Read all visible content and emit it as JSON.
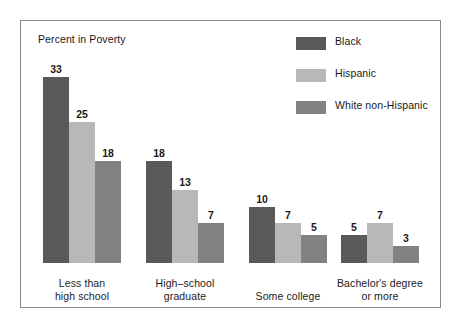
{
  "chart_data": {
    "type": "bar",
    "title": "Percent in Poverty",
    "xlabel": "",
    "ylabel": "",
    "ylim": [
      0,
      35
    ],
    "grid": false,
    "legend_position": "top-right",
    "categories": [
      "Less than\nhigh school",
      "High–school\ngraduate",
      "Some college",
      "Bachelor's degree\nor more"
    ],
    "category_lines": [
      [
        "Less than",
        "high school"
      ],
      [
        "High–school",
        "graduate"
      ],
      [
        "Some college"
      ],
      [
        "Bachelor's degree",
        "or more"
      ]
    ],
    "series": [
      {
        "name": "Black",
        "color": "#595959",
        "values": [
          33,
          18,
          10,
          5
        ]
      },
      {
        "name": "Hispanic",
        "color": "#b8b8b8",
        "values": [
          25,
          13,
          7,
          7
        ]
      },
      {
        "name": "White non-Hispanic",
        "color": "#828282",
        "values": [
          18,
          7,
          5,
          3
        ]
      }
    ]
  },
  "legend": {
    "items": [
      {
        "label": "Black",
        "color": "#595959"
      },
      {
        "label": "Hispanic",
        "color": "#b8b8b8"
      },
      {
        "label": "White non-Hispanic",
        "color": "#828282"
      }
    ]
  },
  "frame": {
    "border_color": "#8a8a8a",
    "background": "#ffffff"
  },
  "layout": {
    "group_left_positions": [
      22,
      125,
      228,
      320
    ],
    "bar_width": 26,
    "px_per_unit": 5.65,
    "baseline_y": 242
  }
}
